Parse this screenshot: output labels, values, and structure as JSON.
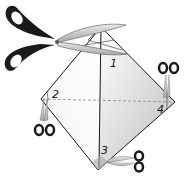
{
  "diagram": {
    "vertices": [
      {
        "id": "1",
        "label": "1"
      },
      {
        "id": "2",
        "label": "2"
      },
      {
        "id": "3",
        "label": "3"
      },
      {
        "id": "4",
        "label": "4"
      }
    ],
    "icons": [
      "large-scissors-icon",
      "small-scissors-icon"
    ],
    "colors": {
      "outline": "#1a1a1a",
      "shade_dark": "#b8b8b8",
      "shade_light": "#f2f2f2",
      "handle": "#1a1a1a",
      "blade": "#cfcfcf",
      "dashed": "#888888"
    }
  }
}
